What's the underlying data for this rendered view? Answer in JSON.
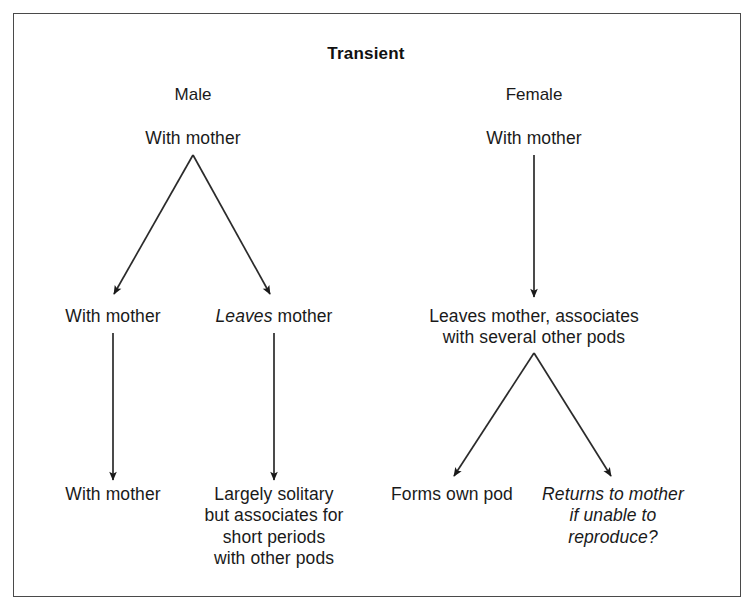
{
  "figure": {
    "title": "Transient",
    "border_color": "#4a4a4a",
    "text_color": "#1a1a1a",
    "background": "#ffffff"
  },
  "columns": [
    {
      "label": "Male",
      "x": 193
    },
    {
      "label": "Female",
      "x": 534
    }
  ],
  "nodes": {
    "male_root": "With mother",
    "male_left_mid": "With mother",
    "male_right_mid_em": "Leaves",
    "male_right_mid_rest": " mother",
    "male_left_leaf": "With mother",
    "male_right_leaf": "Largely solitary\nbut associates for\nshort periods\nwith other pods",
    "female_root": "With mother",
    "female_mid": "Leaves mother, associates\nwith several other pods",
    "female_left_leaf": "Forms own pod",
    "female_right_leaf": "Returns to mother\nif unable to reproduce?"
  },
  "edges": [
    {
      "name": "male-root-to-left",
      "from": [
        193,
        155
      ],
      "to": [
        112,
        297
      ]
    },
    {
      "name": "male-root-to-right",
      "from": [
        193,
        155
      ],
      "to": [
        272,
        297
      ]
    },
    {
      "name": "male-left-mid-to-leaf",
      "from": [
        113,
        333
      ],
      "to": [
        113,
        483
      ]
    },
    {
      "name": "male-right-mid-to-leaf",
      "from": [
        274,
        333
      ],
      "to": [
        274,
        483
      ]
    },
    {
      "name": "female-root-to-mid",
      "from": [
        534,
        155
      ],
      "to": [
        534,
        300
      ]
    },
    {
      "name": "female-mid-to-left",
      "from": [
        534,
        353
      ],
      "to": [
        452,
        479
      ]
    },
    {
      "name": "female-mid-to-right",
      "from": [
        534,
        353
      ],
      "to": [
        613,
        479
      ]
    }
  ]
}
